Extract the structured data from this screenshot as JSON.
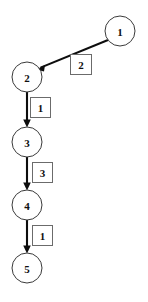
{
  "diagram": {
    "type": "weighted-directed-graph",
    "title": "",
    "background_color": "#ffffff",
    "node_stroke_color": "#3a3a3a",
    "node_fill_color": "#ffffff",
    "edge_color": "#0d0d0d",
    "weight_box_stroke_color": "#6b6b6b",
    "weight_box_fill_color": "#ffffff",
    "text_color": "#101010",
    "nodes": [
      {
        "id": "n1",
        "label": "1",
        "cx": 120,
        "cy": 31,
        "r": 15
      },
      {
        "id": "n2",
        "label": "2",
        "cx": 27,
        "cy": 77,
        "r": 15
      },
      {
        "id": "n3",
        "label": "3",
        "cx": 27,
        "cy": 142,
        "r": 15
      },
      {
        "id": "n4",
        "label": "4",
        "cx": 27,
        "cy": 205,
        "r": 15
      },
      {
        "id": "n5",
        "label": "5",
        "cx": 27,
        "cy": 268,
        "r": 15
      }
    ],
    "edges": [
      {
        "id": "e1",
        "from": "n1",
        "to": "n2",
        "weight": "2",
        "x1": 108,
        "y1": 40,
        "x2": 37,
        "y2": 69,
        "weight_box": {
          "x": 70,
          "y": 54,
          "w": 21,
          "h": 21
        }
      },
      {
        "id": "e2",
        "from": "n2",
        "to": "n3",
        "weight": "1",
        "x1": 27,
        "y1": 92,
        "x2": 27,
        "y2": 126,
        "weight_box": {
          "x": 30,
          "y": 97,
          "w": 20,
          "h": 20
        }
      },
      {
        "id": "e3",
        "from": "n3",
        "to": "n4",
        "weight": "3",
        "x1": 27,
        "y1": 157,
        "x2": 27,
        "y2": 189,
        "weight_box": {
          "x": 32,
          "y": 162,
          "w": 20,
          "h": 20
        }
      },
      {
        "id": "e4",
        "from": "n4",
        "to": "n5",
        "weight": "1",
        "x1": 27,
        "y1": 220,
        "x2": 27,
        "y2": 252,
        "weight_box": {
          "x": 32,
          "y": 225,
          "w": 20,
          "h": 20
        }
      }
    ]
  }
}
